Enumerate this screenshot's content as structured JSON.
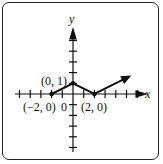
{
  "chart_data": {
    "type": "line",
    "title": "",
    "xlabel": "x",
    "ylabel": "y",
    "xlim": [
      -5.5,
      6.5
    ],
    "ylim": [
      -5.5,
      6
    ],
    "grid": false,
    "series": [
      {
        "name": "graph",
        "x": [
          -2,
          0,
          2,
          5
        ],
        "y": [
          0,
          1,
          0,
          1.5
        ],
        "arrow_end": true
      }
    ],
    "points": [
      {
        "label": "(−2, 0)",
        "x": -2,
        "y": 0
      },
      {
        "label": "(0, 1)",
        "x": 0,
        "y": 1
      },
      {
        "label": "(2, 0)",
        "x": 2,
        "y": 0
      }
    ],
    "annotations": [
      "0"
    ]
  },
  "labels": {
    "x_axis": "x",
    "y_axis": "y",
    "origin": "0",
    "p1": "(−2, 0)",
    "p2": "(0, 1)",
    "p3": "(2, 0)"
  }
}
